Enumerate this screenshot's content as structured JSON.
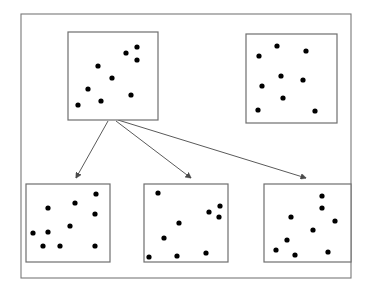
{
  "figure": {
    "type": "diagram",
    "subtype": "data-splitting-scatter-boxes",
    "canvas": {
      "width": 371,
      "height": 293,
      "background": "#ffffff"
    },
    "colors": {
      "dot": "#000000",
      "box_border": "#6e6e6e",
      "frame_border": "#787878",
      "arrow": "#5a5a5a",
      "background": "#ffffff"
    }
  },
  "outer_frame": {
    "label": "outer frame",
    "x": 21,
    "y": 14,
    "width": 330,
    "height": 264
  },
  "boxes": [
    {
      "id": "top-left",
      "label": "",
      "x": 68,
      "y": 32,
      "width": 90,
      "height": 88,
      "dot_count": 9,
      "dots": [
        {
          "cx": 137,
          "cy": 47
        },
        {
          "cx": 126,
          "cy": 53
        },
        {
          "cx": 137,
          "cy": 60
        },
        {
          "cx": 98,
          "cy": 66
        },
        {
          "cx": 112,
          "cy": 78
        },
        {
          "cx": 88,
          "cy": 89
        },
        {
          "cx": 131,
          "cy": 95
        },
        {
          "cx": 101,
          "cy": 101
        },
        {
          "cx": 78,
          "cy": 105
        }
      ]
    },
    {
      "id": "top-right",
      "label": "",
      "x": 246,
      "y": 34,
      "width": 91,
      "height": 89,
      "dot_count": 9,
      "dots": [
        {
          "cx": 277,
          "cy": 46
        },
        {
          "cx": 306,
          "cy": 51
        },
        {
          "cx": 259,
          "cy": 56
        },
        {
          "cx": 281,
          "cy": 76
        },
        {
          "cx": 303,
          "cy": 80
        },
        {
          "cx": 262,
          "cy": 86
        },
        {
          "cx": 283,
          "cy": 98
        },
        {
          "cx": 258,
          "cy": 110
        },
        {
          "cx": 315,
          "cy": 111
        }
      ]
    },
    {
      "id": "bottom-left",
      "label": "",
      "x": 26,
      "y": 184,
      "width": 84,
      "height": 78,
      "dot_count": 9,
      "dots": [
        {
          "cx": 96,
          "cy": 194
        },
        {
          "cx": 75,
          "cy": 203
        },
        {
          "cx": 48,
          "cy": 208
        },
        {
          "cx": 95,
          "cy": 214
        },
        {
          "cx": 70,
          "cy": 226
        },
        {
          "cx": 48,
          "cy": 232
        },
        {
          "cx": 33,
          "cy": 233
        },
        {
          "cx": 43,
          "cy": 246
        },
        {
          "cx": 60,
          "cy": 246
        },
        {
          "cx": 95,
          "cy": 246
        }
      ]
    },
    {
      "id": "bottom-middle",
      "label": "",
      "x": 144,
      "y": 184,
      "width": 84,
      "height": 78,
      "dot_count": 9,
      "dots": [
        {
          "cx": 158,
          "cy": 193
        },
        {
          "cx": 220,
          "cy": 206
        },
        {
          "cx": 209,
          "cy": 212
        },
        {
          "cx": 219,
          "cy": 217
        },
        {
          "cx": 179,
          "cy": 223
        },
        {
          "cx": 164,
          "cy": 238
        },
        {
          "cx": 206,
          "cy": 253
        },
        {
          "cx": 177,
          "cy": 256
        },
        {
          "cx": 149,
          "cy": 257
        }
      ]
    },
    {
      "id": "bottom-right",
      "label": "",
      "x": 264,
      "y": 184,
      "width": 87,
      "height": 78,
      "dot_count": 10,
      "dots": [
        {
          "cx": 322,
          "cy": 196
        },
        {
          "cx": 322,
          "cy": 208
        },
        {
          "cx": 291,
          "cy": 217
        },
        {
          "cx": 335,
          "cy": 221
        },
        {
          "cx": 313,
          "cy": 230
        },
        {
          "cx": 287,
          "cy": 240
        },
        {
          "cx": 276,
          "cy": 250
        },
        {
          "cx": 328,
          "cy": 252
        },
        {
          "cx": 295,
          "cy": 255
        }
      ]
    }
  ],
  "arrows": [
    {
      "id": "arrow-to-bottom-left",
      "label": "",
      "from": {
        "x": 108,
        "y": 121
      },
      "to": {
        "x": 76,
        "y": 178
      }
    },
    {
      "id": "arrow-to-bottom-middle",
      "label": "",
      "from": {
        "x": 116,
        "y": 121
      },
      "to": {
        "x": 191,
        "y": 178
      }
    },
    {
      "id": "arrow-to-bottom-right",
      "label": "",
      "from": {
        "x": 118,
        "y": 120
      },
      "to": {
        "x": 306,
        "y": 178
      }
    }
  ],
  "dot_radius": 2.6
}
